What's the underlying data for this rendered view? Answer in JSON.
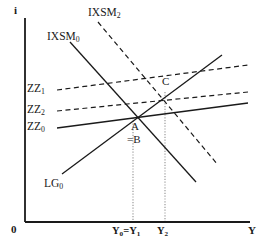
{
  "figure": {
    "type": "economics-line-diagram",
    "background": "#ffffff",
    "ink": "#1a1a1a",
    "guide_color": "#b0b0b0",
    "width": 271,
    "height": 249
  },
  "axes": {
    "y_axis_label": "i",
    "x_axis_label": "Y",
    "origin_label": "0",
    "x_origin_px": 25,
    "y_origin_px": 222,
    "x_end_px": 250,
    "y_top_px": 18
  },
  "curves": [
    {
      "id": "IXSM0",
      "label_text": "IXSM",
      "label_sub": "0",
      "style": "solid",
      "slope": "downward",
      "label_x": 47,
      "label_y": 37,
      "x1": 70,
      "y1": 42,
      "x2": 196,
      "y2": 182
    },
    {
      "id": "IXSM2",
      "label_text": "IXSM",
      "label_sub": "2",
      "style": "dashed",
      "slope": "downward",
      "label_x": 88,
      "label_y": 12,
      "x1": 98,
      "y1": 22,
      "x2": 218,
      "y2": 165
    },
    {
      "id": "ZZ1",
      "label_text": "ZZ",
      "label_sub": "1",
      "style": "dashed",
      "slope": "upward-shallow",
      "label_x": 26,
      "label_y": 85,
      "x1": 57,
      "y1": 90,
      "x2": 248,
      "y2": 65
    },
    {
      "id": "ZZ2",
      "label_text": "ZZ",
      "label_sub": "2",
      "style": "dashed",
      "slope": "upward-shallow",
      "label_x": 26,
      "label_y": 106,
      "x1": 57,
      "y1": 111,
      "x2": 248,
      "y2": 92
    },
    {
      "id": "ZZ0",
      "label_text": "ZZ",
      "label_sub": "0",
      "style": "solid",
      "slope": "upward-shallow",
      "label_x": 26,
      "label_y": 123,
      "x1": 57,
      "y1": 128,
      "x2": 248,
      "y2": 103
    },
    {
      "id": "LG0",
      "label_text": "LG",
      "label_sub": "0",
      "style": "solid",
      "slope": "upward-steep",
      "label_x": 44,
      "label_y": 180,
      "x1": 62,
      "y1": 174,
      "x2": 222,
      "y2": 55
    }
  ],
  "points": [
    {
      "id": "A",
      "label": "A",
      "x_px": 133,
      "y_px": 118,
      "label_x": 132,
      "label_y": 122
    },
    {
      "id": "B",
      "label": "=B",
      "x_px": 133,
      "y_px": 118,
      "label_x": 128,
      "label_y": 135
    },
    {
      "id": "C",
      "label": "C",
      "x_px": 165,
      "y_px": 92,
      "label_x": 163,
      "label_y": 78
    }
  ],
  "guides": [
    {
      "id": "guide-A",
      "x_px": 133,
      "y_top": 118,
      "y_bottom": 222
    },
    {
      "id": "guide-C",
      "x_px": 165,
      "y_top": 92,
      "y_bottom": 222
    }
  ],
  "x_ticks": [
    {
      "id": "Y0Y1",
      "text_a": "Y",
      "sub_a": "0",
      "equals": "=",
      "text_b": "Y",
      "sub_b": "1",
      "x_px": 133,
      "label_x": 113,
      "label_y": 228
    },
    {
      "id": "Y2",
      "text_a": "Y",
      "sub_a": "2",
      "x_px": 165,
      "label_x": 158,
      "label_y": 228
    }
  ]
}
